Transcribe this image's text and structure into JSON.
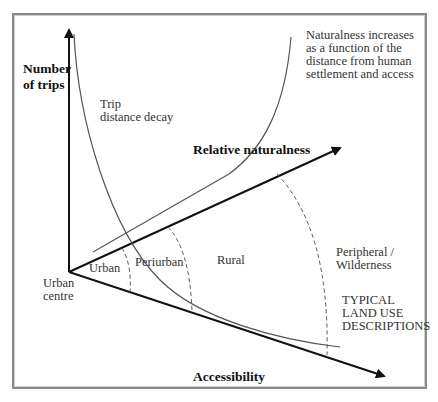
{
  "diagram": {
    "axes": {
      "y_axis": "Number\nof trips",
      "diagonal_axis": "Relative naturalness",
      "lower_axis": "Accessibility"
    },
    "origin_label": "Urban\ncentre",
    "curves": {
      "decay": "Trip\ndistance decay",
      "naturalness_note": "Naturalness increases\nas a function of the\ndistance from human\nsettlement and access"
    },
    "zones": [
      {
        "label": "Urban"
      },
      {
        "label": "Periurban"
      },
      {
        "label": "Rural"
      },
      {
        "label": "Peripheral /\nWilderness"
      }
    ],
    "zones_caption": "TYPICAL\nLAND USE\nDESCRIPTIONS",
    "colors": {
      "axis": "#111111",
      "curve": "#555555",
      "dashed": "#555555",
      "frame": "#8a8a8a"
    }
  }
}
